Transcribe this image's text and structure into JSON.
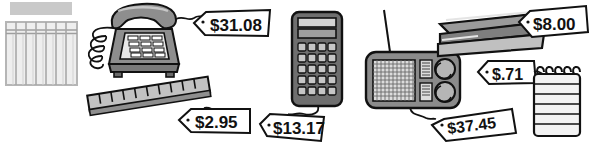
{
  "scene": {
    "title": "Office supplies with handwritten price tags",
    "width": 595,
    "height": 154,
    "background_color": "#ffffff",
    "style": "black-and-white line-art clip-art illustration"
  },
  "palette": {
    "outline": "#111111",
    "paper_white": "#ffffff",
    "light_gray": "#d8d8d8",
    "mid_gray": "#aaaaaa",
    "dark_gray": "#7a7a7a",
    "darker_gray": "#5e5e5e",
    "grid_gray": "#b5b5b5",
    "bar_gray": "#c9c9c9"
  },
  "items": [
    {
      "id": "ledger-pad",
      "name": "ledger-grid-pad",
      "label": "Columnar ledger pad",
      "price": null,
      "columns": 7,
      "has_header_row": true,
      "has_gray_bar": true
    },
    {
      "id": "telephone",
      "name": "desk-telephone",
      "label": "Push-button desk telephone",
      "price": "$31.08",
      "keypad_rows": 4,
      "keypad_cols": 3,
      "has_coiled_cord": true
    },
    {
      "id": "ruler",
      "name": "ruler",
      "label": "Ruler",
      "price": "$2.95",
      "tick_count": 10
    },
    {
      "id": "calculator",
      "name": "calculator",
      "label": "Pocket calculator",
      "price": "$13.17",
      "button_rows": 5,
      "button_cols": 4,
      "has_display": true
    },
    {
      "id": "radio",
      "name": "transistor-radio",
      "label": "Transistor radio with antenna",
      "price": "$37.45",
      "knob_count": 2,
      "has_antenna": true,
      "has_speaker_grille": true
    },
    {
      "id": "stapler",
      "name": "stapler",
      "label": "Desk stapler",
      "price": "$8.00"
    },
    {
      "id": "notepad",
      "name": "spiral-notepad",
      "label": "Spiral-bound notepad",
      "price": "$.71",
      "coil_count": 5,
      "rule_lines": 6
    }
  ],
  "price_tags": [
    {
      "id": "tag-telephone",
      "name": "price-tag-telephone",
      "text": "$31.08",
      "attached_to": "telephone"
    },
    {
      "id": "tag-ruler",
      "name": "price-tag-ruler",
      "text": "$2.95",
      "attached_to": "ruler"
    },
    {
      "id": "tag-calculator",
      "name": "price-tag-calculator",
      "text": "$13.17",
      "attached_to": "calculator"
    },
    {
      "id": "tag-radio",
      "name": "price-tag-radio",
      "text": "$37.45",
      "attached_to": "radio"
    },
    {
      "id": "tag-stapler",
      "name": "price-tag-stapler",
      "text": "$8.00",
      "attached_to": "stapler"
    },
    {
      "id": "tag-notepad",
      "name": "price-tag-notepad",
      "text": "$.71",
      "attached_to": "notepad"
    }
  ]
}
